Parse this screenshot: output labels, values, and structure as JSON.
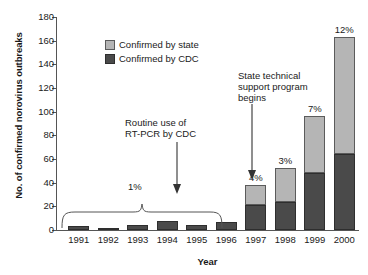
{
  "chart_data": {
    "type": "bar",
    "title": "",
    "xlabel": "Year",
    "ylabel": "No. of confirmed norovirus outbreaks",
    "ylim": [
      0,
      180
    ],
    "ytick_labels": [
      "0",
      "20",
      "40",
      "60",
      "80",
      "100",
      "120",
      "140",
      "160",
      "180"
    ],
    "yticks": [
      0,
      20,
      40,
      60,
      80,
      100,
      120,
      140,
      160,
      180
    ],
    "grid": false,
    "legend_position": "upper-left-inside",
    "stacked": true,
    "categories": [
      "1991",
      "1992",
      "1993",
      "1994",
      "1995",
      "1996",
      "1997",
      "1998",
      "1999",
      "2000"
    ],
    "series": [
      {
        "name": "Confirmed by CDC",
        "color": "#4a4a4a",
        "values": [
          3,
          1,
          4,
          8,
          4,
          7,
          21,
          24,
          48,
          64
        ]
      },
      {
        "name": "Confirmed by state",
        "color": "#b5b5b5",
        "values": [
          0,
          0,
          0,
          0,
          0,
          0,
          17,
          28,
          48,
          99
        ]
      }
    ],
    "totals": [
      3,
      1,
      4,
      8,
      4,
      7,
      38,
      52,
      96,
      163
    ],
    "bar_labels": [
      "",
      "",
      "",
      "",
      "",
      "",
      "4%",
      "3%",
      "7%",
      "12%"
    ],
    "annotations": [
      {
        "name": "routine-rt-pcr",
        "text_lines": [
          "Routine use of",
          "RT-PCR by CDC"
        ],
        "points_to": "1994"
      },
      {
        "name": "state-technical-support",
        "text_lines": [
          "State technical",
          "support program",
          "begins"
        ],
        "points_to": "1997"
      },
      {
        "name": "brace-percentage",
        "text": "1%",
        "spans": [
          "1991",
          "1996"
        ]
      }
    ]
  },
  "axis": {
    "y_title": "No. of confirmed norovirus outbreaks",
    "x_title": "Year"
  },
  "legend": {
    "items": [
      {
        "label": "Confirmed by state",
        "color": "#b5b5b5"
      },
      {
        "label": "Confirmed by CDC",
        "color": "#4a4a4a"
      }
    ]
  },
  "annotation_text": {
    "rtpcr_line1": "Routine use of",
    "rtpcr_line2": "RT-PCR by CDC",
    "state_line1": "State technical",
    "state_line2": "support program",
    "state_line3": "begins",
    "brace_pct": "1%"
  },
  "colors": {
    "state": "#b5b5b5",
    "cdc": "#4a4a4a",
    "axis": "#555555",
    "text": "#1a1a1a",
    "background": "#ffffff"
  }
}
